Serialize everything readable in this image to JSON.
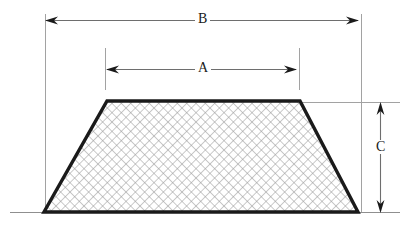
{
  "diagram": {
    "shape": {
      "name": "trapezoid",
      "fill_pattern": "crosshatch-diagonal",
      "outline_color": "#1a1a1a",
      "hatch_color": "#9a9a9a",
      "vertices": {
        "top_left": [
          107,
          101
        ],
        "top_right": [
          300,
          101
        ],
        "bottom_right": [
          358,
          212
        ],
        "bottom_left": [
          44,
          212
        ]
      }
    },
    "dimensions": [
      {
        "id": "B",
        "label": "B",
        "orientation": "horizontal",
        "description": "overall bottom width",
        "line_y": 20,
        "from_x": 45,
        "to_x": 358,
        "extension_x": [
          45,
          361
        ],
        "extension_from_y": 14,
        "extension_to_y": 212
      },
      {
        "id": "A",
        "label": "A",
        "orientation": "horizontal",
        "description": "top width",
        "line_y": 69,
        "from_x": 107,
        "to_x": 296,
        "extension_x": [
          105,
          299
        ],
        "extension_from_y": 48,
        "extension_to_y": 90
      },
      {
        "id": "C",
        "label": "C",
        "orientation": "vertical",
        "description": "height",
        "line_x": 380,
        "from_y": 103,
        "to_y": 212,
        "extension_y": [
          102,
          212
        ],
        "extension_from_x": 300,
        "extension_to_x": 400
      }
    ],
    "baseline": {
      "y": 212,
      "from_x": 10,
      "to_x": 400,
      "color": "#8a8a8a"
    },
    "colors": {
      "background": "#ffffff",
      "outline": "#1a1a1a",
      "hatch": "#9a9a9a",
      "dimension_line": "#6e6e6e",
      "extension_line": "#9a9a9a",
      "text": "#1a1a1a"
    }
  }
}
